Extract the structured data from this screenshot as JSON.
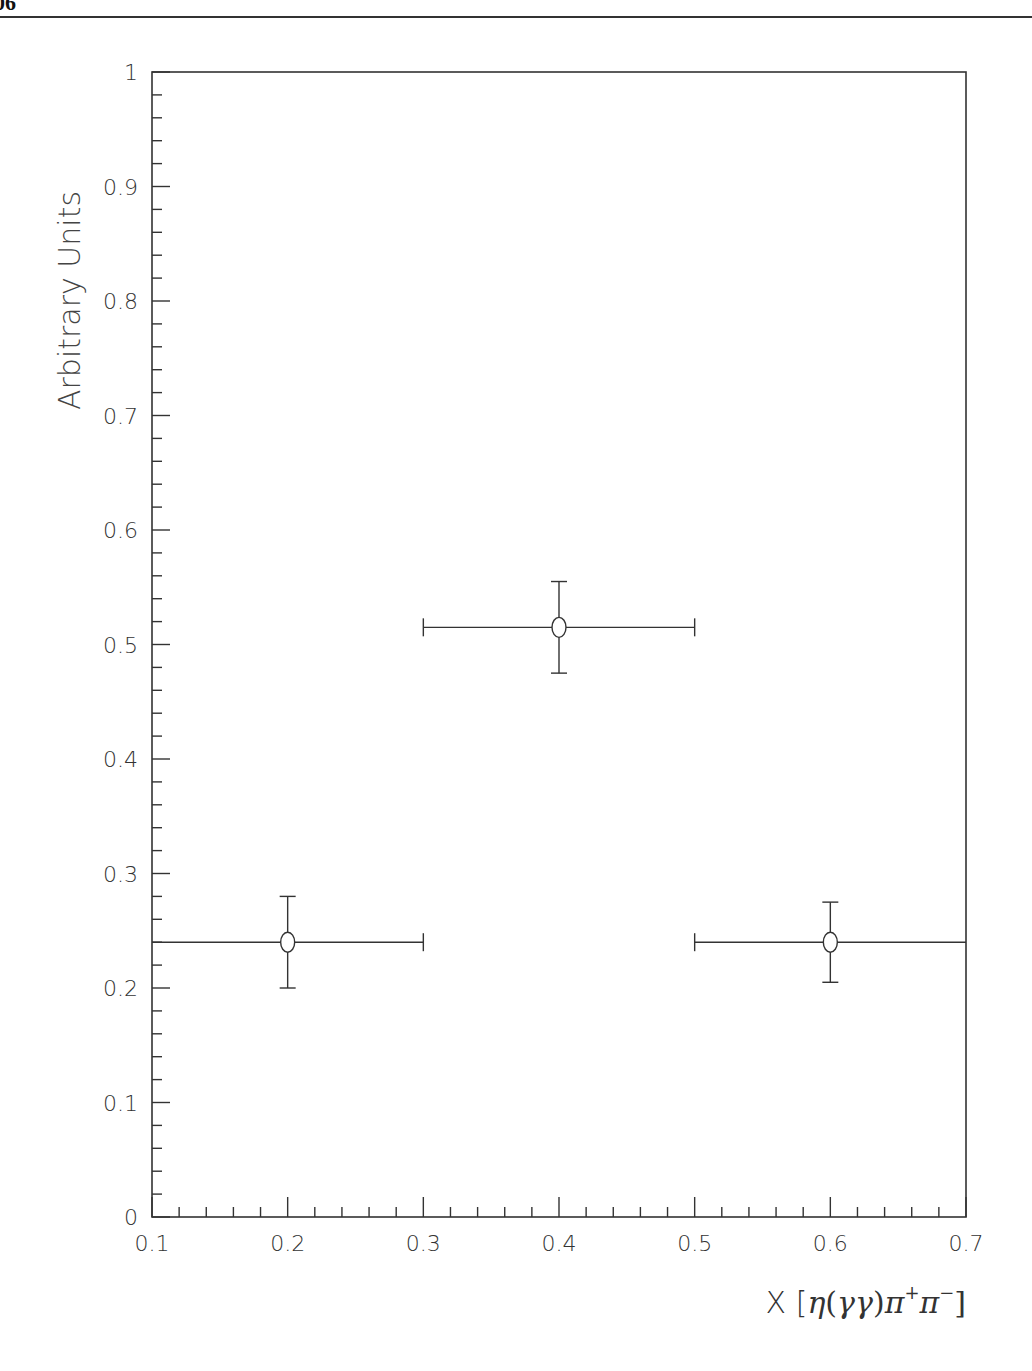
{
  "page": {
    "page_number_fragment": "06"
  },
  "chart_data": {
    "type": "scatter",
    "title": "",
    "xlabel": "X [η(γγ)π⁺π⁻]",
    "xlabel_parts": {
      "prefix": "X [",
      "eta": "η",
      "open": "(",
      "gamma": "γγ",
      "close": ")",
      "pi1": "π",
      "sup1": "+",
      "pi2": "π",
      "sup2": "−",
      "suffix": "]"
    },
    "ylabel": "Arbitrary Units",
    "xlim": [
      0.1,
      0.7
    ],
    "ylim": [
      0,
      1
    ],
    "x_ticks": [
      "0.1",
      "0.2",
      "0.3",
      "0.4",
      "0.5",
      "0.6",
      "0.7"
    ],
    "y_ticks": [
      "0",
      "0.1",
      "0.2",
      "0.3",
      "0.4",
      "0.5",
      "0.6",
      "0.7",
      "0.8",
      "0.9",
      "1"
    ],
    "x_minor_step": 0.02,
    "y_minor_step": 0.02,
    "grid": false,
    "legend": null,
    "marker": "open-circle",
    "series": [
      {
        "name": "data",
        "points": [
          {
            "x": 0.2,
            "y": 0.24,
            "x_low": 0.1,
            "x_high": 0.3,
            "y_err_low": 0.04,
            "y_err_high": 0.04
          },
          {
            "x": 0.4,
            "y": 0.515,
            "x_low": 0.3,
            "x_high": 0.5,
            "y_err_low": 0.04,
            "y_err_high": 0.04
          },
          {
            "x": 0.6,
            "y": 0.24,
            "x_low": 0.5,
            "x_high": 0.7,
            "y_err_low": 0.035,
            "y_err_high": 0.035
          }
        ]
      }
    ]
  }
}
